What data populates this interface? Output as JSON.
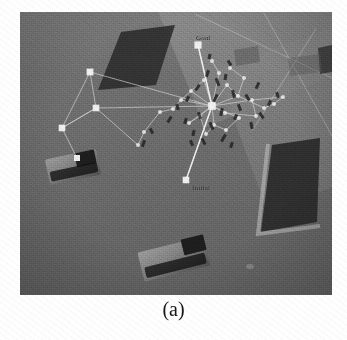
{
  "figure": {
    "caption": "(a)",
    "alt_description": "Overhead view of a simulated urban scene with an RRT search tree grown from the initial configuration toward the goal",
    "panel": {
      "x": 20,
      "y": 12,
      "width": 312,
      "height": 283
    }
  },
  "scene": {
    "background_color": "#6b6b6b",
    "pavement_color": "#8e8e8e",
    "obstacle_color": "#2c2c2c",
    "node_color": "#f2f2f2",
    "edge_color": "#d8d8d8",
    "label_color": "#161616"
  },
  "labels": [
    {
      "id": "goal",
      "text": "Goal",
      "x": 176,
      "y": 22
    },
    {
      "id": "initial",
      "text": "Initial",
      "x": 172,
      "y": 172
    }
  ],
  "obstacles": [
    {
      "id": "building-upper-left",
      "points": "101,20 155,13 136,73 78,78",
      "edge": "none"
    },
    {
      "id": "building-lower-right",
      "points": "252,133 300,126 297,212 241,222",
      "edge": "left-bottom"
    },
    {
      "id": "building-far-right",
      "points": "300,38 330,33 330,58 303,62",
      "edge": "none"
    }
  ],
  "vehicles": [
    {
      "id": "vehicle-left",
      "x": 27,
      "y": 142,
      "width": 52,
      "height": 30,
      "rotation": -12
    },
    {
      "id": "vehicle-bottom",
      "x": 120,
      "y": 234,
      "width": 68,
      "height": 32,
      "rotation": -16
    }
  ],
  "graph": {
    "name": "rrt-search-tree",
    "goal_node": {
      "id": "n-goal",
      "x": 178,
      "y": 33,
      "r": 3.6
    },
    "initial_node": {
      "id": "n-initial",
      "x": 166,
      "y": 168,
      "r": 3.3
    },
    "root_node": {
      "id": "n-root",
      "x": 192,
      "y": 94,
      "r": 3.8
    },
    "nodes": [
      {
        "id": "n1",
        "x": 178,
        "y": 33,
        "r": 3.6
      },
      {
        "id": "n2",
        "x": 192,
        "y": 94,
        "r": 3.8
      },
      {
        "id": "n3",
        "x": 166,
        "y": 168,
        "r": 3.3
      },
      {
        "id": "n4",
        "x": 70,
        "y": 60,
        "r": 3.4
      },
      {
        "id": "n5",
        "x": 76,
        "y": 96,
        "r": 3.3
      },
      {
        "id": "n6",
        "x": 42,
        "y": 116,
        "r": 3.3
      },
      {
        "id": "n7",
        "x": 57,
        "y": 146,
        "r": 3.0
      },
      {
        "id": "n8",
        "x": 199,
        "y": 61,
        "r": 2.1
      },
      {
        "id": "n9",
        "x": 184,
        "y": 68,
        "r": 2.0
      },
      {
        "id": "n10",
        "x": 207,
        "y": 73,
        "r": 2.0
      },
      {
        "id": "n11",
        "x": 171,
        "y": 79,
        "r": 2.0
      },
      {
        "id": "n12",
        "x": 218,
        "y": 84,
        "r": 2.0
      },
      {
        "id": "n13",
        "x": 161,
        "y": 88,
        "r": 2.0
      },
      {
        "id": "n14",
        "x": 232,
        "y": 88,
        "r": 2.0
      },
      {
        "id": "n15",
        "x": 205,
        "y": 101,
        "r": 2.0
      },
      {
        "id": "n16",
        "x": 180,
        "y": 104,
        "r": 2.0
      },
      {
        "id": "n17",
        "x": 219,
        "y": 106,
        "r": 2.0
      },
      {
        "id": "n18",
        "x": 194,
        "y": 113,
        "r": 2.0
      },
      {
        "id": "n19",
        "x": 169,
        "y": 111,
        "r": 2.0
      },
      {
        "id": "n20",
        "x": 244,
        "y": 96,
        "r": 2.0
      },
      {
        "id": "n21",
        "x": 254,
        "y": 92,
        "r": 2.0
      },
      {
        "id": "n22",
        "x": 236,
        "y": 104,
        "r": 2.0
      },
      {
        "id": "n23",
        "x": 206,
        "y": 118,
        "r": 2.0
      },
      {
        "id": "n24",
        "x": 186,
        "y": 122,
        "r": 2.0
      },
      {
        "id": "n25",
        "x": 124,
        "y": 120,
        "r": 2.0
      },
      {
        "id": "n26",
        "x": 140,
        "y": 100,
        "r": 2.0
      },
      {
        "id": "n27",
        "x": 153,
        "y": 97,
        "r": 2.0
      },
      {
        "id": "n28",
        "x": 118,
        "y": 133,
        "r": 2.0
      },
      {
        "id": "n29",
        "x": 263,
        "y": 85,
        "r": 2.0
      },
      {
        "id": "n30",
        "x": 224,
        "y": 66,
        "r": 2.0
      },
      {
        "id": "n31",
        "x": 192,
        "y": 49,
        "r": 2.0
      },
      {
        "id": "n32",
        "x": 210,
        "y": 56,
        "r": 2.0
      }
    ],
    "edges": [
      [
        "n2",
        "n1"
      ],
      [
        "n2",
        "n3"
      ],
      [
        "n2",
        "n4"
      ],
      [
        "n4",
        "n5"
      ],
      [
        "n5",
        "n6"
      ],
      [
        "n6",
        "n7"
      ],
      [
        "n5",
        "n2"
      ],
      [
        "n6",
        "n5"
      ],
      [
        "n4",
        "n6"
      ],
      [
        "n5",
        "n28"
      ],
      [
        "n2",
        "n8"
      ],
      [
        "n2",
        "n9"
      ],
      [
        "n2",
        "n10"
      ],
      [
        "n2",
        "n11"
      ],
      [
        "n2",
        "n12"
      ],
      [
        "n2",
        "n13"
      ],
      [
        "n2",
        "n14"
      ],
      [
        "n2",
        "n15"
      ],
      [
        "n2",
        "n16"
      ],
      [
        "n2",
        "n17"
      ],
      [
        "n2",
        "n18"
      ],
      [
        "n2",
        "n19"
      ],
      [
        "n12",
        "n20"
      ],
      [
        "n20",
        "n21"
      ],
      [
        "n14",
        "n22"
      ],
      [
        "n17",
        "n23"
      ],
      [
        "n18",
        "n24"
      ],
      [
        "n13",
        "n27"
      ],
      [
        "n27",
        "n26"
      ],
      [
        "n26",
        "n25"
      ],
      [
        "n25",
        "n28"
      ],
      [
        "n21",
        "n29"
      ],
      [
        "n12",
        "n30"
      ],
      [
        "n8",
        "n31"
      ],
      [
        "n30",
        "n32"
      ],
      [
        "n14",
        "n29"
      ],
      [
        "n15",
        "n22"
      ],
      [
        "n16",
        "n24"
      ],
      [
        "n11",
        "n13"
      ],
      [
        "n9",
        "n11"
      ],
      [
        "n10",
        "n12"
      ],
      [
        "n19",
        "n16"
      ],
      [
        "n23",
        "n18"
      ]
    ]
  }
}
